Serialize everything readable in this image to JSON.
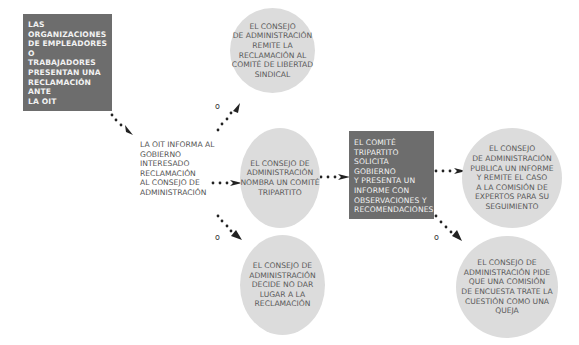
{
  "diagram": {
    "nodes": {
      "start": {
        "text": "LAS\nORGANIZACIONES\nDE EMPLEADORES O\nTRABAJADORES\nPRESENTAN UNA\nRECLAMACIÓN ANTE\nLA OIT"
      },
      "inform": {
        "text": "LA OIT INFORMA AL\nGOBIERNO\nINTERESADO\nRECLAMACIÓN\nAL CONSEJO DE\nADMINISTRACIÓN"
      },
      "refer_cfa": {
        "text": "EL CONSEJO\nDE ADMINISTRACIÓN\nREMITE LA\nRECLAMACIÓN AL\nCOMITÉ DE LIBERTAD\nSINDICAL"
      },
      "tripartite": {
        "text": "EL CONSEJO DE\nADMINISTRACIÓN\nNOMBRA UN COMITÉ\nTRIPARTITO"
      },
      "reject": {
        "text": "EL CONSEJO DE\nADMINISTRACIÓN\nDECIDE NO DAR\nLUGAR A LA\nRECLAMACIÓN"
      },
      "committee_report": {
        "text": "EL COMITÉ\nTRIPARTITO SOLICITA\nGOBIERNO\nY PRESENTA UN\nINFORME CON\nOBSERVACIONES Y\nRECOMENDACIONES"
      },
      "publish": {
        "text": "EL CONSEJO\nDE ADMINISTRACIÓN\nPUBLICA UN INFORME\nY REMITE EL CASO\nA LA COMISIÓN DE\nEXPERTOS PARA SU\nSEGUIMIENTO"
      },
      "inquiry": {
        "text": "EL CONSEJO DE\nADMINISTRACIÓN PIDE\nQUE UNA COMISIÓN\nDE ENCUESTA TRATE LA\nCUESTIÓN COMO UNA\nQUEJA"
      }
    },
    "labels": {
      "or_upper": "o",
      "or_lower": "o",
      "or_right": "o"
    },
    "colors": {
      "dark_box": "#6d6d6d",
      "circle": "#dcdcdc",
      "connector": "#222222"
    }
  }
}
